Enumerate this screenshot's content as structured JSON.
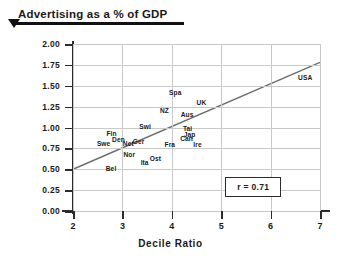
{
  "header": {
    "title": "Advertising as a % of GDP",
    "caret_icon": "triangle-down-icon"
  },
  "annotation": {
    "r_label": "r = 0.71"
  },
  "chart_data": {
    "type": "scatter",
    "title": "Advertising as a % of GDP",
    "xlabel": "Decile Ratio",
    "ylabel": "",
    "xlim": [
      2,
      7
    ],
    "ylim": [
      0.0,
      2.0
    ],
    "grid": true,
    "legend": null,
    "xticks": [
      "2",
      "3",
      "4",
      "5",
      "6",
      "7"
    ],
    "xtick_values": [
      2,
      3,
      4,
      5,
      6,
      7
    ],
    "yticks": [
      "0.00",
      "0.25",
      "0.50",
      "0.75",
      "1.00",
      "1.25",
      "1.50",
      "1.75",
      "2.00"
    ],
    "ytick_values": [
      0.0,
      0.25,
      0.5,
      0.75,
      1.0,
      1.25,
      1.5,
      1.75,
      2.0
    ],
    "correlation": 0.71,
    "annotations": [
      {
        "text": "r = 0.71",
        "x": 5.75,
        "y": 0.3
      }
    ],
    "trendline": {
      "type": "linear",
      "x": [
        2.0,
        7.0
      ],
      "y": [
        0.5,
        1.78
      ]
    },
    "points": [
      {
        "label": "Swe",
        "x": 2.62,
        "y": 0.82
      },
      {
        "label": "Fin",
        "x": 2.78,
        "y": 0.93
      },
      {
        "label": "Den",
        "x": 2.92,
        "y": 0.86
      },
      {
        "label": "Bel",
        "x": 2.77,
        "y": 0.52
      },
      {
        "label": "Net",
        "x": 3.12,
        "y": 0.82
      },
      {
        "label": "Nor",
        "x": 3.14,
        "y": 0.68
      },
      {
        "label": "Ger",
        "x": 3.33,
        "y": 0.84
      },
      {
        "label": "Ita",
        "x": 3.45,
        "y": 0.59
      },
      {
        "label": "Ost",
        "x": 3.67,
        "y": 0.63
      },
      {
        "label": "Swi",
        "x": 3.46,
        "y": 1.02
      },
      {
        "label": "NZ",
        "x": 3.85,
        "y": 1.21
      },
      {
        "label": "Spa",
        "x": 4.07,
        "y": 1.43
      },
      {
        "label": "Fra",
        "x": 3.96,
        "y": 0.8
      },
      {
        "label": "Can",
        "x": 4.3,
        "y": 0.88
      },
      {
        "label": "Aus",
        "x": 4.31,
        "y": 1.16
      },
      {
        "label": "Tai",
        "x": 4.32,
        "y": 0.99
      },
      {
        "label": "Jap",
        "x": 4.36,
        "y": 0.92
      },
      {
        "label": "Ire",
        "x": 4.52,
        "y": 0.8
      },
      {
        "label": "UK",
        "x": 4.6,
        "y": 1.3
      },
      {
        "label": "USA",
        "x": 6.7,
        "y": 1.6
      }
    ]
  }
}
